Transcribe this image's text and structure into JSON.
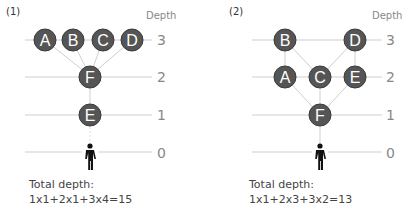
{
  "panels": [
    {
      "label": "(1)",
      "depth_title": "Depth",
      "depth_labels": [
        "3",
        "2",
        "1",
        "0"
      ],
      "nodes": [
        {
          "id": "A",
          "depth": 3
        },
        {
          "id": "B",
          "depth": 3
        },
        {
          "id": "C",
          "depth": 3
        },
        {
          "id": "D",
          "depth": 3
        },
        {
          "id": "F",
          "depth": 2
        },
        {
          "id": "E",
          "depth": 1
        }
      ],
      "edges": [
        [
          "A",
          "F"
        ],
        [
          "B",
          "F"
        ],
        [
          "C",
          "F"
        ],
        [
          "D",
          "F"
        ],
        [
          "F",
          "E"
        ],
        [
          "E",
          "person"
        ]
      ],
      "caption_line1": "Total depth:",
      "caption_line2": "1x1+2x1+3x4=15"
    },
    {
      "label": "(2)",
      "depth_title": "Depth",
      "depth_labels": [
        "3",
        "2",
        "1",
        "0"
      ],
      "nodes": [
        {
          "id": "B",
          "depth": 3
        },
        {
          "id": "D",
          "depth": 3
        },
        {
          "id": "A",
          "depth": 2
        },
        {
          "id": "C",
          "depth": 2
        },
        {
          "id": "E",
          "depth": 2
        },
        {
          "id": "F",
          "depth": 1
        }
      ],
      "edges": [
        [
          "B",
          "A"
        ],
        [
          "B",
          "C"
        ],
        [
          "D",
          "C"
        ],
        [
          "D",
          "E"
        ],
        [
          "A",
          "F"
        ],
        [
          "C",
          "F"
        ],
        [
          "E",
          "F"
        ],
        [
          "F",
          "person"
        ]
      ],
      "caption_line1": "Total depth:",
      "caption_line2": "1x1+2x3+3x2=13"
    }
  ],
  "colors": {
    "node_fill": "#555555",
    "node_stroke": "#3a3a3a",
    "node_text": "#ffffff",
    "line": "#cfcfcf",
    "person": "#111111"
  }
}
